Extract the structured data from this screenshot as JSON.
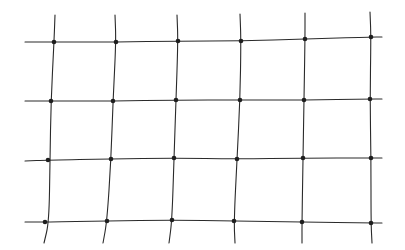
{
  "image": {
    "subject": "netting mesh",
    "background_color": "#ffffff",
    "strand_color": "#2a2a2a",
    "knot_color": "#1e1e1e"
  },
  "mesh": {
    "vertical_strands": [
      {
        "pts": [
          [
            53,
            44
          ],
          [
            52,
            44
          ],
          [
            49,
            100
          ],
          [
            47,
            160
          ],
          [
            45,
            222
          ],
          [
            38,
            243
          ]
        ]
      },
      {
        "pts": [
          [
            55,
            15
          ],
          [
            54,
            42
          ],
          [
            51,
            101
          ],
          [
            50,
            161
          ],
          [
            49,
            222
          ],
          [
            44,
            243
          ]
        ]
      },
      {
        "pts": [
          [
            115,
            15
          ],
          [
            116,
            42
          ],
          [
            113,
            101
          ],
          [
            111,
            159
          ],
          [
            107,
            221
          ],
          [
            103,
            243
          ]
        ]
      },
      {
        "pts": [
          [
            177,
            15
          ],
          [
            178,
            41
          ],
          [
            176,
            100
          ],
          [
            174,
            158
          ],
          [
            172,
            220
          ],
          [
            169,
            243
          ]
        ]
      },
      {
        "pts": [
          [
            240,
            14
          ],
          [
            241,
            41
          ],
          [
            240,
            100
          ],
          [
            237,
            159
          ],
          [
            234,
            221
          ],
          [
            235,
            243
          ]
        ]
      },
      {
        "pts": [
          [
            305,
            13
          ],
          [
            305,
            39
          ],
          [
            304,
            100
          ],
          [
            303,
            158
          ],
          [
            302,
            222
          ],
          [
            302,
            243
          ]
        ]
      },
      {
        "pts": [
          [
            370,
            12
          ],
          [
            371,
            37
          ],
          [
            370,
            99
          ],
          [
            371,
            158
          ],
          [
            371,
            223
          ],
          [
            372,
            243
          ]
        ]
      }
    ],
    "horizontal_strands": [
      {
        "pts": [
          [
            25,
            42
          ],
          [
            54,
            42
          ],
          [
            116,
            42
          ],
          [
            178,
            41
          ],
          [
            241,
            41
          ],
          [
            305,
            39
          ],
          [
            371,
            37
          ],
          [
            382,
            37
          ]
        ]
      },
      {
        "pts": [
          [
            25,
            101
          ],
          [
            51,
            101
          ],
          [
            113,
            101
          ],
          [
            176,
            100
          ],
          [
            240,
            100
          ],
          [
            304,
            100
          ],
          [
            370,
            99
          ],
          [
            382,
            99
          ]
        ]
      },
      {
        "pts": [
          [
            25,
            161
          ],
          [
            48,
            160
          ],
          [
            111,
            159
          ],
          [
            174,
            158
          ],
          [
            237,
            159
          ],
          [
            303,
            158
          ],
          [
            371,
            158
          ],
          [
            382,
            158
          ]
        ]
      },
      {
        "pts": [
          [
            25,
            222
          ],
          [
            45,
            222
          ],
          [
            107,
            221
          ],
          [
            172,
            220
          ],
          [
            234,
            221
          ],
          [
            302,
            222
          ],
          [
            371,
            223
          ],
          [
            382,
            223
          ]
        ]
      }
    ]
  }
}
